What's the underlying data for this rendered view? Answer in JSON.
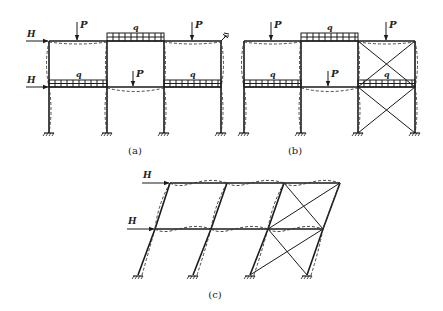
{
  "figure": {
    "panels": [
      {
        "id": "a",
        "caption": "(a)",
        "labels": {
          "horizontal_load": "H",
          "point_load": "P",
          "distributed_load": "q"
        }
      },
      {
        "id": "b",
        "caption": "(b)",
        "labels": {
          "horizontal_load": "H",
          "point_load": "P",
          "distributed_load": "q"
        }
      },
      {
        "id": "c",
        "caption": "(c)",
        "labels": {
          "horizontal_load": "H"
        }
      }
    ]
  },
  "labels": {
    "H": "H",
    "P": "P",
    "q": "q"
  },
  "captions": {
    "a": "(a)",
    "b": "(b)",
    "c": "(c)"
  },
  "colors": {
    "line": "#1a1a1a",
    "background": "#ffffff"
  }
}
